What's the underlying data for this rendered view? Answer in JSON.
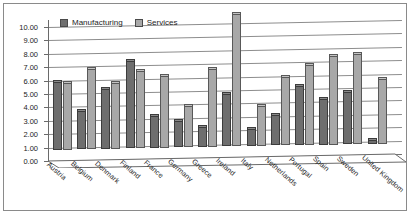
{
  "chart_data": {
    "type": "bar",
    "title": "",
    "subtitle": "",
    "xlabel": "",
    "ylabel": "",
    "ylim": [
      0,
      10
    ],
    "ytick_step": 1,
    "ytick_labels": [
      "0.00",
      "1.00",
      "2.00",
      "3.00",
      "4.00",
      "5.00",
      "6.00",
      "7.00",
      "8.00",
      "9.00",
      "10.00"
    ],
    "grid": true,
    "legend_position": "top-left",
    "categories": [
      "Austria",
      "Belgium",
      "Denmark",
      "Finland",
      "France",
      "Germany",
      "Greece",
      "Ireland",
      "Italy",
      "Netherlands",
      "Portugal",
      "Spain",
      "Sweden",
      "United Kingdom"
    ],
    "series": [
      {
        "name": "Manufacturing",
        "color": "#6e6e6e",
        "values": [
          5.1,
          2.9,
          4.5,
          6.5,
          2.4,
          2.0,
          1.5,
          3.9,
          1.3,
          2.3,
          4.4,
          3.4,
          3.9,
          0.3
        ]
      },
      {
        "name": "Services",
        "color": "#a8a8a8",
        "values": [
          5.0,
          6.0,
          4.9,
          5.8,
          5.4,
          3.1,
          5.8,
          9.9,
          3.0,
          5.1,
          6.0,
          6.6,
          6.7,
          4.8
        ]
      }
    ]
  },
  "colors": {
    "manufacturing": "#6e6e6e",
    "services": "#a8a8a8",
    "gridline": "#8d8d8d",
    "axis": "#6a6a6a",
    "border": "#8a8a8a",
    "text": "#1d1d1d",
    "background": "#ffffff"
  }
}
